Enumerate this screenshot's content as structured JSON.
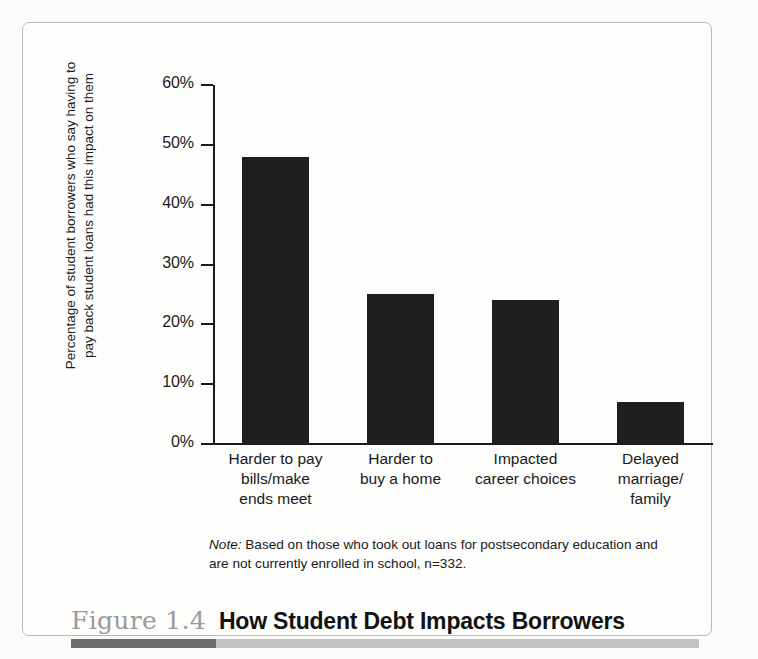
{
  "figure": {
    "number": "Figure 1.4",
    "title": "How Student Debt Impacts Borrowers",
    "accent_dark_color": "#6d6d6d",
    "accent_light_color": "#c2c2c2",
    "frame_border_color": "#b9b9b9"
  },
  "note": {
    "label": "Note:",
    "text": " Based on those who took out loans for postsecondary education and are not currently enrolled in school, n=332."
  },
  "chart_data": {
    "type": "bar",
    "title": "How Student Debt Impacts Borrowers",
    "xlabel": "",
    "ylabel": "Percentage of student borrowers who say having to pay back student loans had this impact on them",
    "categories": [
      "Harder to pay bills/make ends meet",
      "Harder to buy a home",
      "Impacted career choices",
      "Delayed marriage/family"
    ],
    "category_lines": [
      [
        "Harder to pay",
        "bills/make",
        "ends meet"
      ],
      [
        "Harder to",
        "buy a home"
      ],
      [
        "Impacted",
        "career choices"
      ],
      [
        "Delayed",
        "marriage/",
        "family"
      ]
    ],
    "values": [
      48,
      25,
      24,
      7
    ],
    "value_labels": [
      "48%",
      "25%",
      "24%",
      "7%"
    ],
    "ylim": [
      0,
      60
    ],
    "ytick_values": [
      0,
      10,
      20,
      30,
      40,
      50,
      60
    ],
    "ytick_labels": [
      "0%",
      "10%",
      "20%",
      "30%",
      "40%",
      "50%",
      "60%"
    ],
    "grid": false,
    "legend": false,
    "bar_color": "#1f1f1f",
    "axis_color": "#1a1a1a"
  }
}
